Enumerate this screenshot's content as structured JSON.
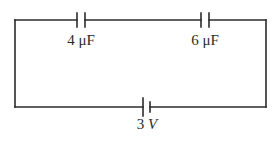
{
  "figure": {
    "name": "series-capacitor-circuit",
    "type": "circuit-diagram",
    "background_color": "#ffffff",
    "line_color": "#2b2b2b",
    "text_color": "#2b2b2b"
  },
  "circuit": {
    "loop": {
      "left_x": 15,
      "right_x": 266,
      "top_y": 20,
      "bottom_y": 107,
      "stroke_width": 1.6
    },
    "components": [
      {
        "id": "capacitor-1",
        "kind": "capacitor",
        "value": "4",
        "unit": "μF",
        "label": "4 μF",
        "label_x": 81,
        "label_y": 33,
        "center_x": 81,
        "center_y": 20,
        "plate_gap": 8,
        "plate_half_height": 7
      },
      {
        "id": "capacitor-2",
        "kind": "capacitor",
        "value": "6",
        "unit": "μF",
        "label": "6 μF",
        "label_x": 205,
        "label_y": 33,
        "center_x": 205,
        "center_y": 20,
        "plate_gap": 8,
        "plate_half_height": 7
      },
      {
        "id": "battery-1",
        "kind": "battery",
        "value": "3",
        "unit": "V",
        "label": "3 V",
        "label_x": 147,
        "label_y": 117,
        "center_x": 147,
        "center_y": 107,
        "plate_gap": 7,
        "long_plate_half_height": 9,
        "short_plate_half_height": 5
      }
    ]
  },
  "labels": {
    "capacitor_1": {
      "number": "4",
      "unit": "μF"
    },
    "capacitor_2": {
      "number": "6",
      "unit": "μF"
    },
    "battery": {
      "number": "3",
      "unit": "V"
    }
  }
}
